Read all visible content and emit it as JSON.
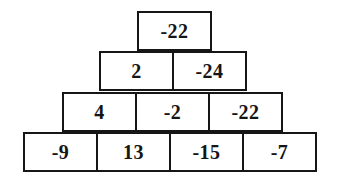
{
  "figure": {
    "type": "number-pyramid",
    "background_color": "#ffffff",
    "border_color": "#161616",
    "text_color": "#151515",
    "rows": [
      {
        "cells": [
          "-22"
        ]
      },
      {
        "cells": [
          "2",
          "-24"
        ]
      },
      {
        "cells": [
          "4",
          "-2",
          "-22"
        ]
      },
      {
        "cells": [
          "-9",
          "13",
          "-15",
          "-7"
        ]
      }
    ]
  },
  "chart_data": {
    "type": "table",
    "title": "",
    "xlabel": "",
    "ylabel": "",
    "levels": [
      {
        "level": 1,
        "values": [
          -22
        ]
      },
      {
        "level": 2,
        "values": [
          2,
          -24
        ]
      },
      {
        "level": 3,
        "values": [
          4,
          -2,
          -22
        ]
      },
      {
        "level": 4,
        "values": [
          -9,
          13,
          -15,
          -7
        ]
      }
    ]
  }
}
